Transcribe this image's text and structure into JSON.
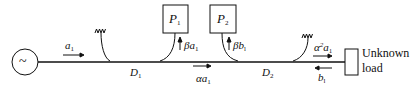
{
  "diagram": {
    "type": "microwave reflectometer / directional coupler measurement setup",
    "source": {
      "symbol": "~",
      "label": "signal-source"
    },
    "couplers": [
      {
        "id": "D1",
        "label": "D",
        "sub": "1"
      },
      {
        "id": "D2",
        "label": "D",
        "sub": "2"
      }
    ],
    "detectors": [
      {
        "id": "P1",
        "label": "P",
        "sub": "1",
        "signal": {
          "pre": "β",
          "var": "a",
          "sub": "1"
        }
      },
      {
        "id": "P2",
        "label": "P",
        "sub": "2",
        "signal": {
          "pre": "β",
          "var": "b",
          "sub": "l"
        }
      }
    ],
    "waves": {
      "incident": {
        "var": "a",
        "sub": "1"
      },
      "between_couplers": {
        "pre": "α",
        "var": "a",
        "sub": "1"
      },
      "at_load": {
        "pre": "α",
        "sup": "2",
        "var": "a",
        "sub": "1"
      },
      "reflected": {
        "var": "b",
        "sub": "l"
      }
    },
    "load": {
      "line1": "Unknown",
      "line2": "load"
    },
    "terminations": [
      "matched-load-D1",
      "matched-load-D2"
    ]
  }
}
